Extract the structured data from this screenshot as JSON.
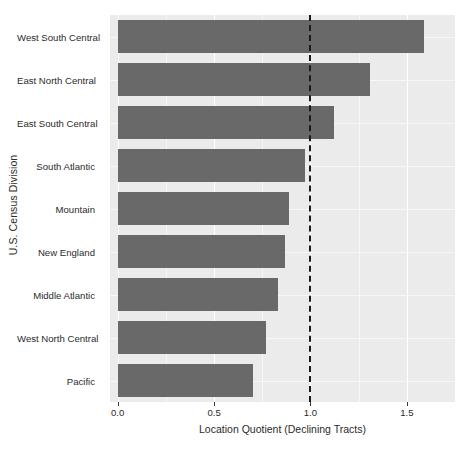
{
  "chart_data": {
    "type": "bar",
    "orientation": "horizontal",
    "title": "",
    "xlabel": "Location Quotient (Declining Tracts)",
    "ylabel": "U.S. Census Division",
    "categories": [
      "West South Central",
      "East North Central",
      "East South Central",
      "South Atlantic",
      "Mountain",
      "New England",
      "Middle Atlantic",
      "West North Central",
      "Pacific"
    ],
    "values": [
      1.59,
      1.31,
      1.12,
      0.97,
      0.89,
      0.87,
      0.83,
      0.77,
      0.7
    ],
    "xlim": [
      -0.04,
      1.75
    ],
    "xticks": [
      0.0,
      0.5,
      1.0,
      1.5
    ],
    "xtick_labels": [
      "0.0",
      "0.5",
      "1.0",
      "1.5"
    ],
    "grid": true,
    "legend": null,
    "annotations": [
      {
        "type": "reference-line",
        "orientation": "vertical",
        "value": 1.0,
        "style": "dashed",
        "color": "#1a1a1a"
      }
    ],
    "colors": {
      "bar_fill": "#696969",
      "panel_background": "#ebebeb",
      "grid_major": "#ffffff",
      "figure_background": "#ffffff",
      "text": "#2b2b2b"
    }
  }
}
